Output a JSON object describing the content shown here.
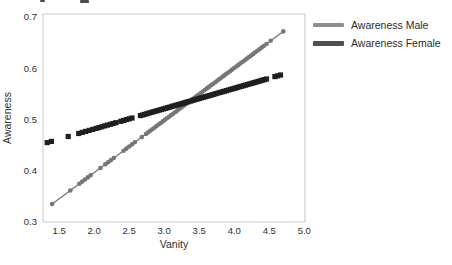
{
  "chart_data": {
    "type": "scatter",
    "title": "",
    "xlabel": "Vanity",
    "ylabel": "Awareness",
    "xlim": [
      1.27,
      5.01
    ],
    "ylim": [
      0.3,
      0.706
    ],
    "xticks": [
      "1.5",
      "2.0",
      "2.5",
      "3.0",
      "3.5",
      "4.0",
      "4.5",
      "5.0"
    ],
    "yticks": [
      "0.3",
      "0.4",
      "0.5",
      "0.6",
      "0.7"
    ],
    "grid": false,
    "frame_color": "#c9c9c9",
    "legend_position": "outside-top-right",
    "series": [
      {
        "id": "male",
        "name": "Awareness Male",
        "color": "#767676",
        "legend_color": "#8e8e8e",
        "legend_swatch_height": 4,
        "marker": "circle",
        "marker_size": 4.6,
        "line": true,
        "line_width": 1.3,
        "fit_line": {
          "x0": 1.4,
          "y0": 0.335,
          "x1": 4.7,
          "y1": 0.672
        },
        "x": [
          1.4,
          1.66,
          1.79,
          1.83,
          1.87,
          1.91,
          1.95,
          2.09,
          2.16,
          2.2,
          2.24,
          2.28,
          2.42,
          2.46,
          2.5,
          2.54,
          2.58,
          2.68,
          2.74,
          2.77,
          2.8,
          2.83,
          2.86,
          2.89,
          2.92,
          2.95,
          2.98,
          3.01,
          3.04,
          3.07,
          3.1,
          3.13,
          3.16,
          3.19,
          3.22,
          3.25,
          3.28,
          3.31,
          3.34,
          3.37,
          3.4,
          3.43,
          3.46,
          3.49,
          3.52,
          3.55,
          3.58,
          3.61,
          3.64,
          3.67,
          3.7,
          3.73,
          3.76,
          3.79,
          3.82,
          3.85,
          3.88,
          3.91,
          3.94,
          3.97,
          4.0,
          4.03,
          4.06,
          4.09,
          4.12,
          4.15,
          4.18,
          4.21,
          4.24,
          4.27,
          4.3,
          4.33,
          4.36,
          4.39,
          4.42,
          4.46,
          4.52,
          4.7
        ]
      },
      {
        "id": "female",
        "name": "Awareness Female",
        "color": "#1f1f1f",
        "legend_color": "#4f4f4f",
        "legend_swatch_height": 5,
        "marker": "square",
        "marker_size": 5.2,
        "line": false,
        "line_width": 0,
        "fit_line": {
          "x0": 1.33,
          "y0": 0.455,
          "x1": 4.66,
          "y1": 0.587
        },
        "x": [
          1.33,
          1.39,
          1.63,
          1.78,
          1.83,
          1.88,
          1.93,
          1.98,
          2.03,
          2.07,
          2.11,
          2.15,
          2.19,
          2.23,
          2.27,
          2.31,
          2.38,
          2.42,
          2.46,
          2.5,
          2.54,
          2.66,
          2.69,
          2.72,
          2.75,
          2.78,
          2.81,
          2.84,
          2.87,
          2.9,
          2.93,
          2.96,
          2.99,
          3.02,
          3.05,
          3.08,
          3.11,
          3.14,
          3.17,
          3.2,
          3.23,
          3.26,
          3.29,
          3.32,
          3.35,
          3.38,
          3.41,
          3.44,
          3.47,
          3.5,
          3.53,
          3.56,
          3.59,
          3.62,
          3.65,
          3.68,
          3.71,
          3.74,
          3.77,
          3.8,
          3.83,
          3.86,
          3.89,
          3.92,
          3.95,
          3.98,
          4.01,
          4.04,
          4.07,
          4.1,
          4.13,
          4.16,
          4.19,
          4.22,
          4.25,
          4.28,
          4.31,
          4.34,
          4.37,
          4.4,
          4.43,
          4.46,
          4.58,
          4.62,
          4.66
        ]
      }
    ]
  }
}
